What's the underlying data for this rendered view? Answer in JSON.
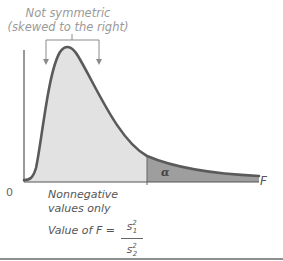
{
  "annotation": {
    "line1": "Not symmetric",
    "line2": "(skewed to the right)"
  },
  "axis": {
    "origin_label": "0",
    "x_label": "F"
  },
  "region": {
    "tail_label": "α"
  },
  "notes": {
    "nonnegative_line1": "Nonnegative",
    "nonnegative_line2": "values only",
    "value_of": "Value of F =",
    "numerator": "s",
    "numerator_sup": "2",
    "numerator_sub": "1",
    "denominator": "s",
    "denominator_sup": "2",
    "denominator_sub": "2"
  },
  "colors": {
    "curve": "#5a5a5a",
    "body_fill": "#e2e2e2",
    "tail_fill": "#9e9e9e",
    "axis": "#555555",
    "annotation_text": "#9a9a9a",
    "rule": "#6a6a6a"
  }
}
